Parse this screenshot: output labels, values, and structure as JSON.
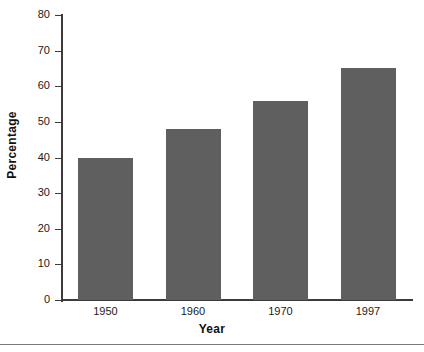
{
  "chart_data": {
    "type": "bar",
    "title": "",
    "subtitle": "",
    "xlabel": "Year",
    "ylabel": "Percentage",
    "categories": [
      "1950",
      "1960",
      "1970",
      "1997"
    ],
    "values": [
      40,
      48,
      56,
      65
    ],
    "series": [
      {
        "name": "Percentage",
        "values": [
          40,
          48,
          56,
          65
        ]
      }
    ],
    "ylim": [
      0,
      80
    ],
    "yticks": [
      0,
      10,
      20,
      30,
      40,
      50,
      60,
      70,
      80
    ],
    "ytick_labels": [
      "0",
      "10",
      "20",
      "30",
      "40",
      "50",
      "60",
      "70",
      "80"
    ],
    "xtick_labels": [
      "1950",
      "1960",
      "1970",
      "1997"
    ],
    "grid": false,
    "legend": false,
    "legend_position": "none",
    "bar_color": "#605f5f",
    "axis_color": "#3b3b3b",
    "text_color": "#1a1a1a",
    "background_color": "#ffffff",
    "annotations": []
  }
}
